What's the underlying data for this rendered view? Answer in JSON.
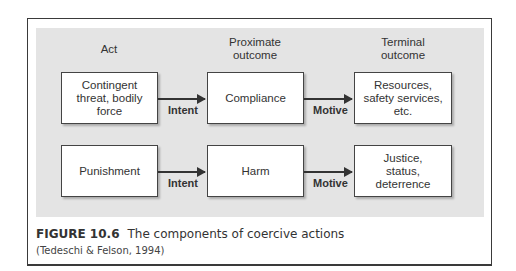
{
  "figure": {
    "columns": [
      "Act",
      "Proximate\noutcome",
      "Terminal\noutcome"
    ],
    "rows": [
      {
        "act": "Contingent threat, bodily force",
        "proximate": "Compliance",
        "terminal": "Resources, safety services, etc.",
        "link1": "Intent",
        "link2": "Motive"
      },
      {
        "act": "Punishment",
        "proximate": "Harm",
        "terminal": "Justice, status, deterrence",
        "link1": "Intent",
        "link2": "Motive"
      }
    ],
    "caption_label": "FIGURE 10.6",
    "caption_text": "The components of coercive actions",
    "source": "(Tedeschi & Felson, 1994)",
    "colors": {
      "panel": "#e4e4e4",
      "border": "#3a3a3a",
      "box": "#ffffff"
    }
  }
}
